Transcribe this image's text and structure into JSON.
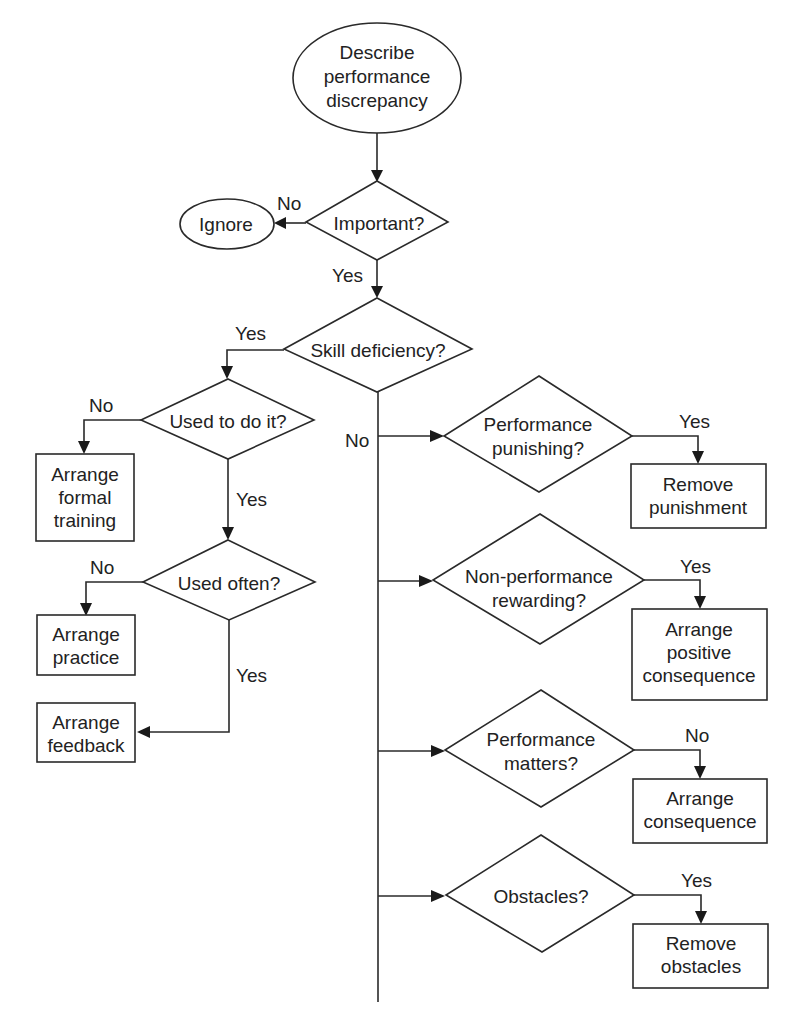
{
  "diagram": {
    "type": "flowchart",
    "nodes": {
      "start": {
        "shape": "ellipse",
        "lines": [
          "Describe",
          "performance",
          "discrepancy"
        ]
      },
      "important": {
        "shape": "diamond",
        "lines": [
          "Important?"
        ]
      },
      "ignore": {
        "shape": "ellipse",
        "lines": [
          "Ignore"
        ]
      },
      "skill": {
        "shape": "diamond",
        "lines": [
          "Skill deficiency?"
        ]
      },
      "used_to": {
        "shape": "diamond",
        "lines": [
          "Used to do it?"
        ]
      },
      "formal_training": {
        "shape": "rect",
        "lines": [
          "Arrange",
          "formal",
          "training"
        ]
      },
      "used_often": {
        "shape": "diamond",
        "lines": [
          "Used often?"
        ]
      },
      "practice": {
        "shape": "rect",
        "lines": [
          "Arrange",
          "practice"
        ]
      },
      "feedback": {
        "shape": "rect",
        "lines": [
          "Arrange",
          "feedback"
        ]
      },
      "punishing": {
        "shape": "diamond",
        "lines": [
          "Performance",
          "punishing?"
        ]
      },
      "remove_punishment": {
        "shape": "rect",
        "lines": [
          "Remove",
          "punishment"
        ]
      },
      "nonperf_rewarding": {
        "shape": "diamond",
        "lines": [
          "Non-performance",
          "rewarding?"
        ]
      },
      "positive_consequence": {
        "shape": "rect",
        "lines": [
          "Arrange",
          "positive",
          "consequence"
        ]
      },
      "matters": {
        "shape": "diamond",
        "lines": [
          "Performance",
          "matters?"
        ]
      },
      "consequence": {
        "shape": "rect",
        "lines": [
          "Arrange",
          "consequence"
        ]
      },
      "obstacles": {
        "shape": "diamond",
        "lines": [
          "Obstacles?"
        ]
      },
      "remove_obstacles": {
        "shape": "rect",
        "lines": [
          "Remove",
          "obstacles"
        ]
      }
    },
    "edges": [
      {
        "from": "start",
        "to": "important",
        "label": ""
      },
      {
        "from": "important",
        "to": "ignore",
        "label": "No"
      },
      {
        "from": "important",
        "to": "skill",
        "label": "Yes"
      },
      {
        "from": "skill",
        "to": "used_to",
        "label": "Yes"
      },
      {
        "from": "skill",
        "to": "punishing",
        "label": "No"
      },
      {
        "from": "used_to",
        "to": "formal_training",
        "label": "No"
      },
      {
        "from": "used_to",
        "to": "used_often",
        "label": "Yes"
      },
      {
        "from": "used_often",
        "to": "practice",
        "label": "No"
      },
      {
        "from": "used_often",
        "to": "feedback",
        "label": "Yes"
      },
      {
        "from": "punishing",
        "to": "remove_punishment",
        "label": "Yes"
      },
      {
        "from": "nonperf_rewarding",
        "to": "positive_consequence",
        "label": "Yes"
      },
      {
        "from": "matters",
        "to": "consequence",
        "label": "No"
      },
      {
        "from": "obstacles",
        "to": "remove_obstacles",
        "label": "Yes"
      }
    ],
    "edge_labels": {
      "important_no": "No",
      "important_yes": "Yes",
      "skill_yes": "Yes",
      "skill_no": "No",
      "used_to_no": "No",
      "used_to_yes": "Yes",
      "used_often_no": "No",
      "used_often_yes": "Yes",
      "punishing_yes": "Yes",
      "rewarding_yes": "Yes",
      "matters_no": "No",
      "obstacles_yes": "Yes"
    },
    "colors": {
      "stroke": "#2a2a2a",
      "text": "#222222",
      "background": "#ffffff"
    }
  }
}
